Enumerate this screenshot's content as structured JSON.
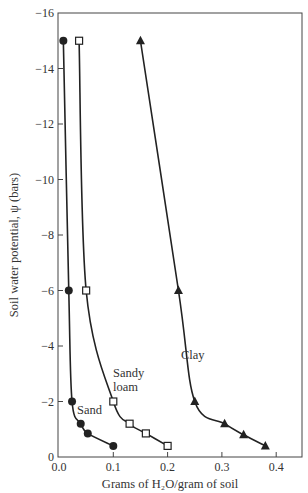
{
  "chart_data": {
    "type": "line",
    "title": "",
    "xlabel": "Grams of H₂O/gram of soil",
    "ylabel": "Soil water potential, ψ (bars)",
    "xlim": [
      0.0,
      0.45
    ],
    "ylim": [
      0,
      -16
    ],
    "x_ticks": [
      0.0,
      0.1,
      0.2,
      0.3,
      0.4
    ],
    "x_tick_labels": [
      "0.0",
      "0.1",
      "0.2",
      "0.3",
      "0.4"
    ],
    "y_ticks": [
      0,
      -2,
      -4,
      -6,
      -8,
      -10,
      -12,
      -14,
      -16
    ],
    "y_tick_labels": [
      "0",
      "−2",
      "−4",
      "−6",
      "−8",
      "−10",
      "−12",
      "−14",
      "−16"
    ],
    "grid": false,
    "legend": "none (direct labels)",
    "series": [
      {
        "name": "Sand",
        "marker": "filled-circle",
        "color": "#222222",
        "x": [
          0.008,
          0.018,
          0.024,
          0.04,
          0.053,
          0.1
        ],
        "y": [
          -15,
          -6,
          -2,
          -1.2,
          -0.85,
          -0.4
        ]
      },
      {
        "name": "Sandy loam",
        "label_lines": [
          "Sandy",
          "loam"
        ],
        "marker": "open-square",
        "color": "#222222",
        "x": [
          0.037,
          0.05,
          0.1,
          0.13,
          0.16,
          0.2
        ],
        "y": [
          -15,
          -6,
          -2,
          -1.2,
          -0.85,
          -0.4
        ]
      },
      {
        "name": "Clay",
        "marker": "filled-triangle",
        "color": "#222222",
        "x": [
          0.15,
          0.22,
          0.25,
          0.305,
          0.34,
          0.38
        ],
        "y": [
          -15,
          -6,
          -2,
          -1.2,
          -0.8,
          -0.4
        ]
      }
    ]
  }
}
